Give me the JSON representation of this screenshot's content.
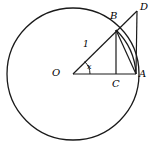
{
  "figure": {
    "type": "geometry-diagram",
    "stroke_color": "#1a1a1a",
    "background_color": "#ffffff",
    "circle": {
      "center_label": "O",
      "cx": 73,
      "cy": 74,
      "r": 66,
      "radius_value": "1"
    },
    "points": {
      "O": {
        "x": 73,
        "y": 74,
        "label": "O",
        "label_x": 52,
        "label_y": 68
      },
      "A": {
        "x": 136,
        "y": 74,
        "label": "A",
        "label_x": 139,
        "label_y": 69
      },
      "B": {
        "x": 116,
        "y": 30,
        "label": "B",
        "label_x": 110,
        "label_y": 11
      },
      "C": {
        "x": 116,
        "y": 74,
        "label": "C",
        "label_x": 112,
        "label_y": 79
      },
      "D": {
        "x": 137,
        "y": 11,
        "label": "D",
        "label_x": 140,
        "label_y": 2
      }
    },
    "labels": {
      "radius": "1",
      "radius_x": 83,
      "radius_y": 40,
      "angle": "x",
      "angle_x": 87,
      "angle_y": 63,
      "point_O": "O",
      "point_A": "A",
      "point_B": "B",
      "point_C": "C",
      "point_D": "D"
    },
    "segments": [
      {
        "name": "radius-OB-extended-to-D",
        "from": "O",
        "to": "D"
      },
      {
        "name": "base-OA",
        "from": "O",
        "to": "A"
      },
      {
        "name": "tangent-AD",
        "from": "A",
        "to": "D"
      },
      {
        "name": "perpendicular-BC",
        "from": "B",
        "to": "C"
      },
      {
        "name": "chord-BA",
        "from": "B",
        "to": "A"
      }
    ],
    "arcs": [
      {
        "name": "arc-BA-on-circle",
        "from": "B",
        "to": "A"
      },
      {
        "name": "angle-arc-at-O",
        "radius": 17
      }
    ]
  }
}
